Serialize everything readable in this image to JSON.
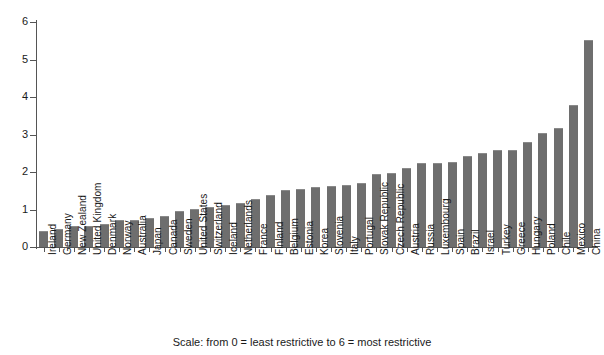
{
  "caption": "Scale: from 0 = least restrictive to 6 = most restrictive",
  "colors": {
    "bar": "#6e6e6e",
    "axis": "#555555",
    "text": "#1a1a1a",
    "background": "#ffffff"
  },
  "chart_data": {
    "type": "bar",
    "title": "",
    "subtitle": "",
    "xlabel": "",
    "ylabel": "",
    "ylim": [
      0,
      6
    ],
    "yticks": [
      0,
      1,
      2,
      3,
      4,
      5,
      6
    ],
    "ytick_labels": [
      "0",
      "1",
      "2",
      "3",
      "4",
      "5",
      "6"
    ],
    "grid": false,
    "legend": false,
    "annotations": [
      "Scale: from 0 = least restrictive to 6 = most restrictive"
    ],
    "categories": [
      "Ireland",
      "Germany",
      "New Zealand",
      "United Kingdom",
      "Denmark",
      "Norway",
      "Australia",
      "Japan",
      "Canada",
      "Sweden",
      "United States",
      "Switzerland",
      "Iceland",
      "Netherlands",
      "France",
      "Finland",
      "Belgium",
      "Estonia",
      "Korea",
      "Slovenia",
      "Italy",
      "Portugal",
      "Slovak Republic",
      "Czech Republic",
      "Austria",
      "Russia",
      "Luxembourg",
      "Spain",
      "Brazil",
      "Israel",
      "Turkey",
      "Greece",
      "Hungary",
      "Poland",
      "Chile",
      "Mexico",
      "China"
    ],
    "values": [
      0.42,
      0.47,
      0.55,
      0.55,
      0.62,
      0.72,
      0.73,
      0.78,
      0.83,
      0.97,
      1.02,
      1.07,
      1.12,
      1.18,
      1.28,
      1.4,
      1.53,
      1.56,
      1.6,
      1.62,
      1.65,
      1.72,
      1.95,
      1.98,
      2.1,
      2.25,
      2.25,
      2.28,
      2.42,
      2.5,
      2.58,
      2.6,
      2.8,
      3.05,
      3.18,
      3.78,
      5.53
    ]
  }
}
